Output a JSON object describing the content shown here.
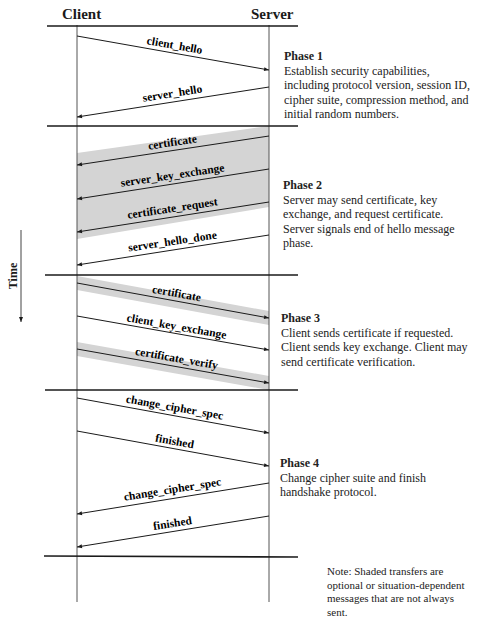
{
  "headers": {
    "client": "Client",
    "server": "Server"
  },
  "time_axis": {
    "label": "Time",
    "direction": "down"
  },
  "colors": {
    "line": "#1a1a1a",
    "lifeline": "#555555",
    "shade": "#d4d4d4",
    "background": "#ffffff"
  },
  "phases": [
    {
      "title": "Phase 1",
      "description": "Establish security capabilities, including protocol version, session ID, cipher suite, compression method, and initial random numbers.",
      "messages": [
        {
          "label": "client_hello",
          "direction": "client-to-server",
          "shaded": false
        },
        {
          "label": "server_hello",
          "direction": "server-to-client",
          "shaded": false
        }
      ]
    },
    {
      "title": "Phase 2",
      "description": "Server may send certificate, key exchange, and request certificate. Server signals end of hello message phase.",
      "messages": [
        {
          "label": "certificate",
          "direction": "server-to-client",
          "shaded": true
        },
        {
          "label": "server_key_exchange",
          "direction": "server-to-client",
          "shaded": true
        },
        {
          "label": "certificate_request",
          "direction": "server-to-client",
          "shaded": true
        },
        {
          "label": "server_hello_done",
          "direction": "server-to-client",
          "shaded": false
        }
      ]
    },
    {
      "title": "Phase 3",
      "description": "Client sends certificate if requested. Client sends key exchange. Client may send certificate verification.",
      "messages": [
        {
          "label": "certificate",
          "direction": "client-to-server",
          "shaded": true
        },
        {
          "label": "client_key_exchange",
          "direction": "client-to-server",
          "shaded": false
        },
        {
          "label": "certificate_verify",
          "direction": "client-to-server",
          "shaded": true
        }
      ]
    },
    {
      "title": "Phase 4",
      "description": "Change cipher suite and finish handshake protocol.",
      "messages": [
        {
          "label": "change_cipher_spec",
          "direction": "client-to-server",
          "shaded": false
        },
        {
          "label": "finished",
          "direction": "client-to-server",
          "shaded": false
        },
        {
          "label": "change_cipher_spec",
          "direction": "server-to-client",
          "shaded": false
        },
        {
          "label": "finished",
          "direction": "server-to-client",
          "shaded": false
        }
      ]
    }
  ],
  "note": "Note: Shaded transfers are optional or situation-dependent messages that are not always sent."
}
